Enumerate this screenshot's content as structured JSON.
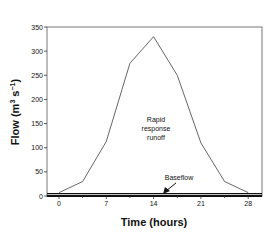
{
  "chart_data": {
    "type": "line",
    "title": "",
    "xlabel": "Time (hours)",
    "ylabel": "Flow (m³ s⁻¹)",
    "xlim": [
      -2,
      30
    ],
    "ylim": [
      0,
      350
    ],
    "x_ticks": [
      0,
      7,
      14,
      21,
      28
    ],
    "x_minor_ticks": [
      3.5,
      10.5,
      17.5,
      24.5
    ],
    "y_ticks": [
      0,
      50,
      100,
      150,
      200,
      250,
      300,
      350
    ],
    "grid": false,
    "legend": null,
    "series": [
      {
        "name": "Rapid response runoff",
        "x": [
          0,
          3.5,
          7,
          10.5,
          14,
          17.5,
          21,
          24.5,
          28
        ],
        "values": [
          7,
          30,
          113,
          275,
          330,
          250,
          110,
          30,
          7
        ]
      },
      {
        "name": "Baseflow",
        "x": [
          0,
          28
        ],
        "values": [
          5,
          5
        ]
      }
    ],
    "annotations": [
      {
        "text": "Rapid response runoff",
        "lines": [
          "Rapid",
          "response",
          "runoff"
        ],
        "x": 14,
        "y": 150
      },
      {
        "text": "Baseflow",
        "x": 16,
        "y": 20,
        "arrow_to": [
          14.5,
          5
        ]
      }
    ]
  },
  "labels": {
    "xlabel": "Time (hours)",
    "ylabel_main": "Flow (m",
    "ylabel_sup1": "3",
    "ylabel_mid": " s",
    "ylabel_sup2": "−1",
    "ylabel_end": ")",
    "runoff_line1": "Rapid",
    "runoff_line2": "response",
    "runoff_line3": "runoff",
    "baseflow": "Baseflow"
  }
}
